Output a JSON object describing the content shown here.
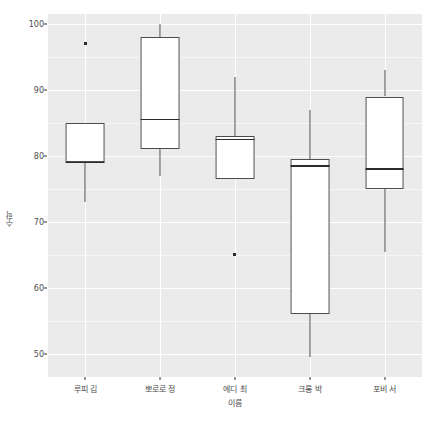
{
  "chart_data": {
    "type": "box",
    "title": "",
    "xlabel": "이름",
    "ylabel": "수학",
    "categories": [
      "루피 김",
      "뽀로로 정",
      "에디 최",
      "크롱 박",
      "포비 서"
    ],
    "ylim": [
      46.5,
      101.5
    ],
    "yticks": [
      50,
      60,
      70,
      80,
      90,
      100
    ],
    "ytick_labels": [
      "50",
      "60",
      "70",
      "80",
      "90",
      "100"
    ],
    "grid": "major and minor horizontal white lines, major vertical white lines",
    "legend": "none",
    "panel_background": "#ebebeb",
    "box_fill": "#ffffff",
    "box_line": "#4d4d4d",
    "boxes": [
      {
        "name": "루피 김",
        "lower_whisker": 73.0,
        "q1": 79.0,
        "median": 79.0,
        "q3": 85.0,
        "upper_whisker": 85.0,
        "outliers": [
          97.0
        ]
      },
      {
        "name": "뽀로로 정",
        "lower_whisker": 77.0,
        "q1": 81.0,
        "median": 85.5,
        "q3": 98.0,
        "upper_whisker": 100.0,
        "outliers": []
      },
      {
        "name": "에디 최",
        "lower_whisker": 76.5,
        "q1": 76.5,
        "median": 82.5,
        "q3": 83.0,
        "upper_whisker": 92.0,
        "outliers": [
          65.0
        ]
      },
      {
        "name": "크롱 박",
        "lower_whisker": 49.5,
        "q1": 56.0,
        "median": 78.5,
        "q3": 79.5,
        "upper_whisker": 87.0,
        "outliers": []
      },
      {
        "name": "포비 서",
        "lower_whisker": 65.5,
        "q1": 75.0,
        "median": 78.0,
        "q3": 89.0,
        "upper_whisker": 93.0,
        "outliers": []
      }
    ]
  }
}
